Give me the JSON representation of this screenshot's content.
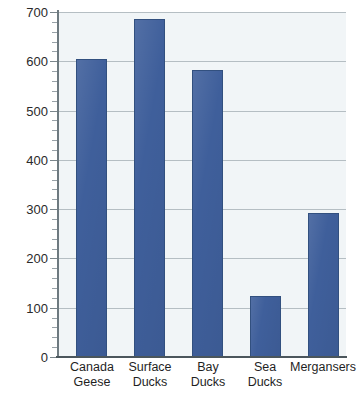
{
  "chart_data": {
    "type": "bar",
    "title": "",
    "subtitle": "",
    "xlabel": "",
    "ylabel": "",
    "categories": [
      "Canada Geese",
      "Surface Ducks",
      "Bay Ducks",
      "Sea Ducks",
      "Mergansers"
    ],
    "category_lines": [
      [
        "Canada",
        "Geese"
      ],
      [
        "Surface",
        "Ducks"
      ],
      [
        "Bay",
        "Ducks"
      ],
      [
        "Sea",
        "Ducks"
      ],
      [
        "Mergansers",
        ""
      ]
    ],
    "values": [
      605,
      685,
      582,
      123,
      292
    ],
    "ylim": [
      0,
      700
    ],
    "ytick_values": [
      0,
      100,
      200,
      300,
      400,
      500,
      600,
      700
    ],
    "ytick_labels": [
      "0",
      "100",
      "200",
      "300",
      "400",
      "500",
      "600",
      "700"
    ],
    "yminor_step": 20,
    "grid": true,
    "legend": "none",
    "legend_position": "none",
    "colors": {
      "bar_fill": "#3f5f9b",
      "bar_border": "#32507f",
      "plot_background": "#f1f5f7",
      "gridline": "#b5bec3",
      "axis_line": "#4b565c",
      "tick_label": "#2a2a2a",
      "page_background": "#ffffff"
    }
  }
}
